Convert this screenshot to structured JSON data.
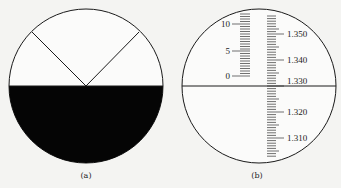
{
  "figure": {
    "panels": [
      {
        "id": "a",
        "label": "(a)",
        "description": "Refractometer field of view: upper half light, lower half dark, V-shaped crosshair meeting at the boundary center"
      },
      {
        "id": "b",
        "label": "(b)",
        "description": "Refractometer reading scale with horizontal reference line",
        "left_scale": {
          "labels": [
            "10",
            "5",
            "0"
          ],
          "values": [
            10,
            5,
            0
          ]
        },
        "right_scale": {
          "labels": [
            "1.350",
            "1.340",
            "1.330",
            "1.320",
            "1.310"
          ],
          "values": [
            1.35,
            1.34,
            1.33,
            1.32,
            1.31
          ]
        },
        "reference_line_value": "1.330"
      }
    ],
    "colors": {
      "ink": "#1a1a1a",
      "background": "#f4f4f2",
      "dark_field": "#050505"
    }
  }
}
